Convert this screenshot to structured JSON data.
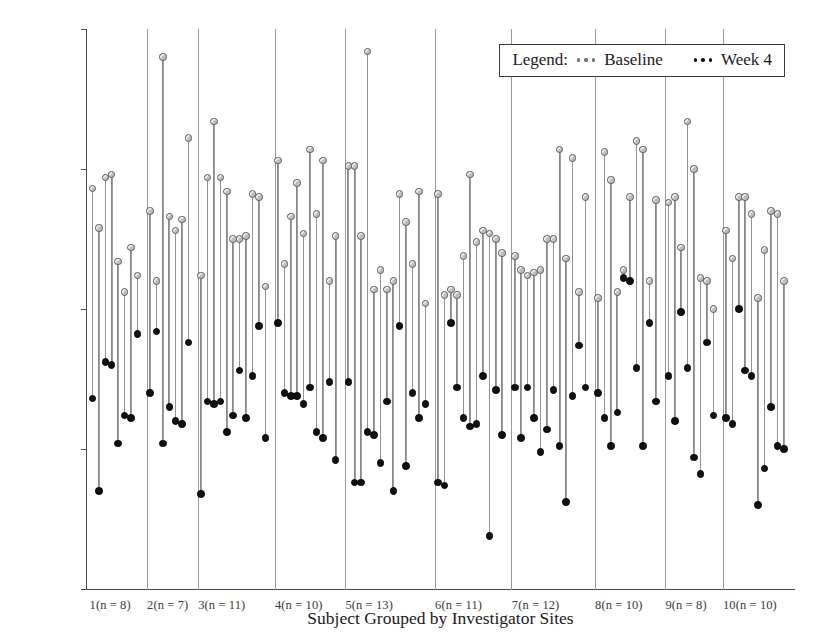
{
  "chart_data": {
    "type": "scatter",
    "title": "",
    "xlabel": "Subject Grouped by Investigator Sites",
    "ylabel": "Mean Diurnal IOP at Baseline and Week 4 (mm Hg)",
    "ylim": [
      10,
      30
    ],
    "yticks": [
      10,
      15,
      20,
      25,
      30
    ],
    "grid": false,
    "legend": {
      "title": "Legend:",
      "position": "top-right",
      "entries": [
        {
          "name": "Baseline",
          "marker": "open-gray-circle",
          "color": "#bdbdbd"
        },
        {
          "name": "Week 4",
          "marker": "filled-black-circle",
          "color": "#111111"
        }
      ]
    },
    "series": [
      {
        "name": "Baseline",
        "color": "#bdbdbd"
      },
      {
        "name": "Week 4",
        "color": "#111111"
      }
    ],
    "groups": [
      {
        "label": "1(n = 8)",
        "site": 1,
        "n": 8,
        "baseline": [
          24.3,
          22.9,
          24.7,
          24.8,
          21.7,
          20.6,
          22.2,
          21.2
        ],
        "week4": [
          16.8,
          13.5,
          18.1,
          18.0,
          15.2,
          16.2,
          16.1,
          19.1
        ]
      },
      {
        "label": "2(n = 7)",
        "site": 2,
        "n": 7,
        "baseline": [
          23.5,
          21.0,
          29.0,
          23.3,
          22.8,
          23.2,
          26.1
        ],
        "week4": [
          17.0,
          19.2,
          15.2,
          16.5,
          16.0,
          15.9,
          18.8
        ]
      },
      {
        "label": "3(n = 11)",
        "site": 3,
        "n": 11,
        "baseline": [
          21.2,
          24.7,
          26.7,
          24.7,
          24.2,
          22.5,
          22.5,
          22.6,
          24.1,
          24.0,
          20.8
        ],
        "week4": [
          13.4,
          16.7,
          16.6,
          16.7,
          15.6,
          16.2,
          17.8,
          16.1,
          17.6,
          19.4,
          15.4
        ]
      },
      {
        "label": "4(n = 10)",
        "site": 4,
        "n": 10,
        "baseline": [
          25.3,
          21.6,
          23.3,
          24.5,
          22.7,
          25.7,
          23.4,
          25.3,
          21.0,
          22.6
        ],
        "week4": [
          19.5,
          17.0,
          16.9,
          16.9,
          16.6,
          17.2,
          15.6,
          15.4,
          17.4,
          14.6
        ]
      },
      {
        "label": "5(n = 13)",
        "site": 5,
        "n": 13,
        "baseline": [
          25.1,
          25.1,
          22.6,
          29.2,
          20.7,
          21.4,
          20.7,
          21.0,
          24.1,
          23.1,
          21.6,
          24.2,
          20.2
        ],
        "week4": [
          17.4,
          13.8,
          13.8,
          15.6,
          15.5,
          14.5,
          16.7,
          13.5,
          19.4,
          14.4,
          17.0,
          16.1,
          16.6
        ]
      },
      {
        "label": "6(n = 11)",
        "site": 6,
        "n": 11,
        "baseline": [
          24.1,
          20.5,
          20.7,
          20.5,
          21.9,
          24.8,
          22.4,
          22.8,
          22.7,
          22.5,
          22.0
        ],
        "week4": [
          13.8,
          13.7,
          19.5,
          17.2,
          16.1,
          15.8,
          15.9,
          17.6,
          11.9,
          17.1,
          15.5
        ]
      },
      {
        "label": "7(n = 12)",
        "site": 7,
        "n": 12,
        "baseline": [
          21.9,
          21.4,
          21.2,
          21.3,
          21.4,
          22.5,
          22.5,
          25.7,
          21.8,
          25.4,
          20.6,
          24.0
        ],
        "week4": [
          17.2,
          15.4,
          17.2,
          16.1,
          14.9,
          15.7,
          17.1,
          15.1,
          13.1,
          16.9,
          18.7,
          17.2
        ]
      },
      {
        "label": "8(n = 10)",
        "site": 8,
        "n": 10,
        "baseline": [
          20.4,
          25.6,
          24.6,
          20.6,
          21.4,
          24.0,
          26.0,
          25.7,
          21.0,
          23.9
        ],
        "week4": [
          17.0,
          16.1,
          15.1,
          16.3,
          21.1,
          21.0,
          17.9,
          15.1,
          19.5,
          16.7
        ]
      },
      {
        "label": "9(n = 8)",
        "site": 9,
        "n": 8,
        "baseline": [
          23.8,
          24.0,
          22.2,
          26.7,
          25.0,
          21.1,
          21.0,
          20.0
        ],
        "week4": [
          17.6,
          16.0,
          19.9,
          17.9,
          14.7,
          14.1,
          18.8,
          16.2
        ]
      },
      {
        "label": "10(n = 10)",
        "site": 10,
        "n": 10,
        "baseline": [
          22.8,
          21.8,
          24.0,
          24.0,
          23.4,
          20.4,
          22.1,
          23.5,
          23.4,
          21.0
        ],
        "week4": [
          16.1,
          15.9,
          20.0,
          17.8,
          17.6,
          13.0,
          14.3,
          16.5,
          15.1,
          15.0
        ]
      }
    ]
  }
}
